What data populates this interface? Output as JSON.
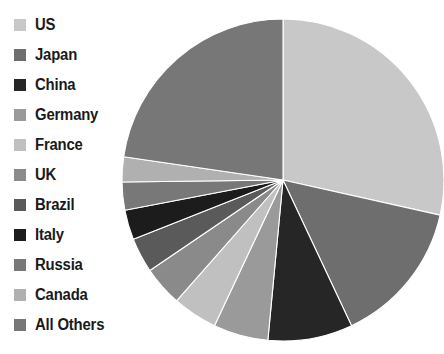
{
  "chart_data": {
    "type": "pie",
    "title": "",
    "subtitle": "",
    "xlabel": "",
    "ylabel": "",
    "legend_position": "left",
    "grid": false,
    "start_angle_deg": 0,
    "direction": "clockwise",
    "categories": [
      "US",
      "Japan",
      "China",
      "Germany",
      "France",
      "UK",
      "Brazil",
      "Italy",
      "Russia",
      "Canada",
      "All Others"
    ],
    "values": [
      28.5,
      14.5,
      8.5,
      5.5,
      4.5,
      4.0,
      3.5,
      3.0,
      2.8,
      2.5,
      22.7
    ],
    "units": "percent",
    "colors": [
      "#c8c8c8",
      "#6e6e6e",
      "#262626",
      "#9a9a9a",
      "#c0c0c0",
      "#8a8a8a",
      "#5a5a5a",
      "#1c1c1c",
      "#787878",
      "#b0b0b0",
      "#777777"
    ],
    "slices": [
      {
        "label": "US",
        "value": 28.5,
        "color": "#c8c8c8"
      },
      {
        "label": "Japan",
        "value": 14.5,
        "color": "#6e6e6e"
      },
      {
        "label": "China",
        "value": 8.5,
        "color": "#262626"
      },
      {
        "label": "Germany",
        "value": 5.5,
        "color": "#9a9a9a"
      },
      {
        "label": "France",
        "value": 4.5,
        "color": "#c0c0c0"
      },
      {
        "label": "UK",
        "value": 4.0,
        "color": "#8a8a8a"
      },
      {
        "label": "Brazil",
        "value": 3.5,
        "color": "#5a5a5a"
      },
      {
        "label": "Italy",
        "value": 3.0,
        "color": "#1c1c1c"
      },
      {
        "label": "Russia",
        "value": 2.8,
        "color": "#787878"
      },
      {
        "label": "Canada",
        "value": 2.5,
        "color": "#b0b0b0"
      },
      {
        "label": "All Others",
        "value": 22.7,
        "color": "#777777"
      }
    ]
  },
  "legend": {
    "items": [
      {
        "label": "US",
        "color": "#c8c8c8",
        "swatch": "legend-swatch-icon"
      },
      {
        "label": "Japan",
        "color": "#6e6e6e",
        "swatch": "legend-swatch-icon"
      },
      {
        "label": "China",
        "color": "#262626",
        "swatch": "legend-swatch-icon"
      },
      {
        "label": "Germany",
        "color": "#9a9a9a",
        "swatch": "legend-swatch-icon"
      },
      {
        "label": "France",
        "color": "#c0c0c0",
        "swatch": "legend-swatch-icon"
      },
      {
        "label": "UK",
        "color": "#8a8a8a",
        "swatch": "legend-swatch-icon"
      },
      {
        "label": "Brazil",
        "color": "#5a5a5a",
        "swatch": "legend-swatch-icon"
      },
      {
        "label": "Italy",
        "color": "#1c1c1c",
        "swatch": "legend-swatch-icon"
      },
      {
        "label": "Russia",
        "color": "#787878",
        "swatch": "legend-swatch-icon"
      },
      {
        "label": "Canada",
        "color": "#b0b0b0",
        "swatch": "legend-swatch-icon"
      },
      {
        "label": "All Others",
        "color": "#777777",
        "swatch": "legend-swatch-icon"
      }
    ]
  },
  "canvas": {
    "background": "#ffffff",
    "pie_center_x": 162,
    "pie_center_y": 162,
    "pie_radius": 161
  }
}
